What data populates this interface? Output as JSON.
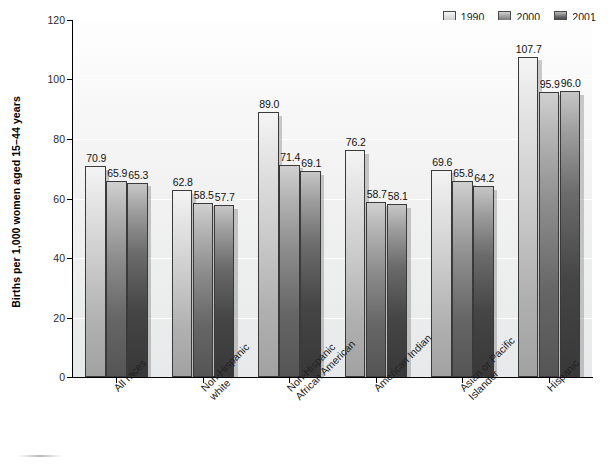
{
  "chart_data": {
    "type": "bar",
    "title": "",
    "xlabel": "",
    "ylabel": "Births per 1,000 women aged 15–44 years",
    "ylim": [
      0,
      120
    ],
    "yticks": [
      0,
      20,
      40,
      60,
      80,
      100,
      120
    ],
    "grid": true,
    "legend_position": "top-right",
    "categories": [
      "All races",
      "Non-Hispanic white",
      "Non-Hispanic African American",
      "American Indian",
      "Asian or Pacific Islander",
      "Hispanic"
    ],
    "category_lines": [
      [
        "All races"
      ],
      [
        "Non-Hispanic",
        "white"
      ],
      [
        "Non-Hispanic",
        "African American"
      ],
      [
        "American Indian"
      ],
      [
        "Asian or Pacific",
        "Islander"
      ],
      [
        "Hispanic"
      ]
    ],
    "series": [
      {
        "name": "1990",
        "color": "#d9d9d9",
        "values": [
          70.9,
          62.8,
          89.0,
          76.2,
          69.6,
          107.7
        ],
        "labels": [
          "70.9",
          "62.8",
          "89.0",
          "76.2",
          "69.6",
          "107.7"
        ]
      },
      {
        "name": "2000",
        "color": "#8a8a8a",
        "values": [
          65.9,
          58.5,
          71.4,
          58.7,
          65.8,
          95.9
        ],
        "labels": [
          "65.9",
          "58.5",
          "71.4",
          "58.7",
          "65.8",
          "95.9"
        ]
      },
      {
        "name": "2001",
        "color": "#3f3f3f",
        "values": [
          65.3,
          57.7,
          69.1,
          58.1,
          64.2,
          96.0
        ],
        "labels": [
          "65.3",
          "57.7",
          "69.1",
          "58.1",
          "64.2",
          "96.0"
        ]
      }
    ]
  }
}
